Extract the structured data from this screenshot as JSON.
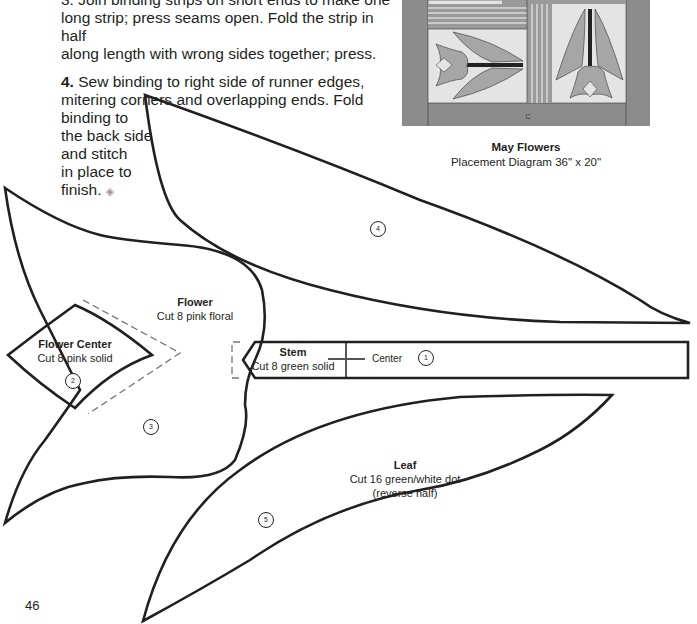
{
  "instructions": {
    "step3_partial": "3. Join binding strips on short ends to make one",
    "step3_line2": "long strip; press seams open. Fold the strip in half",
    "step3_line3": "along length with wrong sides together; press.",
    "step4_num": "4.",
    "step4_line1": " Sew binding to right side of runner edges,",
    "step4_line2": "mitering corners and overlapping ends. Fold",
    "step4_line3": "binding to",
    "step4_line4": "the back side",
    "step4_line5": "and stitch",
    "step4_line6": "in place to",
    "step4_line7": "finish.",
    "end_icon": "◈"
  },
  "placement": {
    "title": "May Flowers",
    "subtitle": "Placement Diagram 36\" x 20\"",
    "border_label": "C"
  },
  "pattern_pieces": [
    {
      "id": "1",
      "name": "Stem",
      "cut": "Cut 8 green solid",
      "marker": "Center"
    },
    {
      "id": "2",
      "name": "Flower Center",
      "cut": "Cut 8 pink solid"
    },
    {
      "id": "3",
      "name": "Flower",
      "cut": "Cut 8 pink floral"
    },
    {
      "id": "4",
      "name": "Leaf",
      "cut": ""
    },
    {
      "id": "5",
      "name": "Leaf",
      "cut": "Cut 16 green/white dot",
      "note": "(reverse half)"
    }
  ],
  "page_number": "46",
  "colors": {
    "outline": "#231f20",
    "dashed": "#777777",
    "quilt_border": "#8c8c8c",
    "quilt_bg": "#e4e4e4",
    "petal": "#a6a6a6"
  }
}
